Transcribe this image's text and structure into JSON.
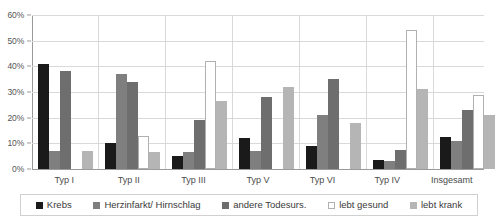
{
  "chart_data": {
    "type": "bar",
    "title": "",
    "subtitle": "",
    "xlabel": "",
    "ylabel": "",
    "ylim": [
      0,
      60
    ],
    "ytick_labels": [
      "60%",
      "50%",
      "40%",
      "30%",
      "20%",
      "10%",
      "0%"
    ],
    "ytick_values": [
      60,
      50,
      40,
      30,
      20,
      10,
      0
    ],
    "grid": true,
    "legend_position": "bottom",
    "categories": [
      "Typ I",
      "Typ II",
      "Typ III",
      "Typ V",
      "Typ VI",
      "Typ IV",
      "Insgesamt"
    ],
    "series": [
      {
        "name": "Krebs",
        "color": "#1a1a1a",
        "border": "#1a1a1a",
        "values": [
          41,
          10,
          5,
          12,
          9,
          3.5,
          12.5
        ]
      },
      {
        "name": "Herzinfarkt/ Hirnschlag",
        "color": "#7f7f7f",
        "border": "#7f7f7f",
        "values": [
          7,
          37,
          6.5,
          7,
          21,
          3,
          11
        ]
      },
      {
        "name": "andere Todesurs.",
        "color": "#6e6e6e",
        "border": "#6e6e6e",
        "values": [
          38,
          34,
          19,
          28,
          35,
          7.5,
          23
        ]
      },
      {
        "name": "lebt gesund",
        "color": "#ffffff",
        "border": "#b0b0b0",
        "values": [
          0,
          13,
          42,
          0,
          0,
          54,
          29
        ]
      },
      {
        "name": "lebt krank",
        "color": "#b5b5b5",
        "border": "#b5b5b5",
        "values": [
          7,
          6.5,
          26.5,
          32,
          18,
          31,
          21
        ]
      }
    ]
  },
  "axis": {
    "line_color": "#9a9a9a",
    "grid_color": "#d9d9d9"
  },
  "legend": {
    "border_color": "#d0d0d0"
  }
}
